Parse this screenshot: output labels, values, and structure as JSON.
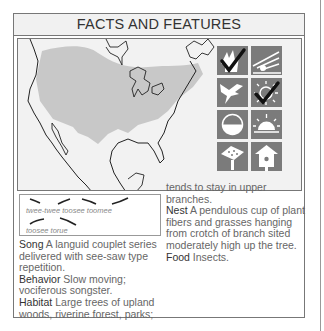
{
  "header": {
    "title": "FACTS AND FEATURES"
  },
  "map": {
    "range_color": "#c8c8c8",
    "land_color": "#f2f2f2",
    "border_color": "#222222"
  },
  "icons": [
    {
      "name": "woodland-habitat-icon",
      "checked": true
    },
    {
      "name": "open-habitat-icon",
      "checked": false
    },
    {
      "name": "flying-bird-icon",
      "checked": false
    },
    {
      "name": "sun-resident-icon",
      "checked": true
    },
    {
      "name": "half-moon-icon",
      "checked": false
    },
    {
      "name": "sunrise-icon",
      "checked": false
    },
    {
      "name": "feeder-icon",
      "checked": false
    },
    {
      "name": "birdhouse-icon",
      "checked": false
    }
  ],
  "song_box": {
    "line1": "twee-twee toosee toomee",
    "line2": "toosee torue"
  },
  "facts": {
    "song_label": "Song",
    "song_text": " A languid couplet series delivered with see-saw type repetition.",
    "behavior_label": "Behavior",
    "behavior_text": " Slow moving; vociferous songster.",
    "habitat_label": "Habitat",
    "habitat_text": " Large trees of upland woods, riverine forest, parks; tends to stay in upper branches.",
    "habitat_text_part1": " Large trees of upland woods, riverine forest, parks;",
    "habitat_text_part2": "tends to stay in upper branches.",
    "nest_label": "Nest",
    "nest_text": " A pendulous cup of plant fibers and grasses hanging from crotch of branch sited moderately high up the tree.",
    "food_label": "Food",
    "food_text": " Insects."
  }
}
